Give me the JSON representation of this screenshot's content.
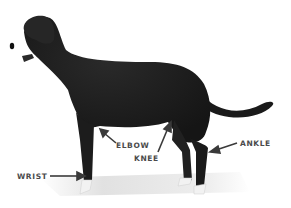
{
  "diagram": {
    "colors": {
      "body": "#1c1c1c",
      "shadow": "#dcdcdc",
      "paw": "#f2f2f2",
      "label_text": "#4a4a4a",
      "arrow": "#3a3a3a",
      "background": "#ffffff"
    },
    "labels": [
      {
        "id": "elbow",
        "text": "ELBOW"
      },
      {
        "id": "knee",
        "text": "KNEE"
      },
      {
        "id": "ankle",
        "text": "ANKLE"
      },
      {
        "id": "wrist",
        "text": "WRIST"
      }
    ]
  }
}
